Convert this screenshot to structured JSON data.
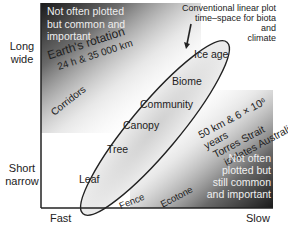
{
  "y_axis": {
    "top_label_line1": "Long",
    "top_label_line2": "wide",
    "bottom_label_line1": "Short",
    "bottom_label_line2": "narrow"
  },
  "x_axis": {
    "left_label": "Fast",
    "right_label": "Slow"
  },
  "corners": {
    "top_left_line1": "Not often plotted",
    "top_left_line2": "but common and",
    "top_left_line3": "important",
    "bottom_right_line1": "Not often",
    "bottom_right_line2": "plotted but",
    "bottom_right_line3": "still common",
    "bottom_right_line4": "and important"
  },
  "callout": {
    "line1": "Conventional linear plot",
    "line2": "time–space for biota and",
    "line3": "climate"
  },
  "earth_rotation": {
    "line1": "Earth's rotation",
    "line2": "24 h & 35 000 km"
  },
  "torres": {
    "line1": "50 km & 6 × 10⁶ years",
    "line2": "Torres Strait",
    "line3": "isolates Australia"
  },
  "outside_labels": {
    "corridors": "Corridors",
    "fence": "Fence",
    "ecotone": "Ecotone"
  },
  "ellipse_items": [
    "Ice age",
    "Biome",
    "Community",
    "Canopy",
    "Tree",
    "Leaf"
  ],
  "colors": {
    "axis": "#222222",
    "corner_dark": "#1a1a1a",
    "ellipse_fill": "#e4e4e4",
    "corner_text": "#f0f0f0"
  }
}
